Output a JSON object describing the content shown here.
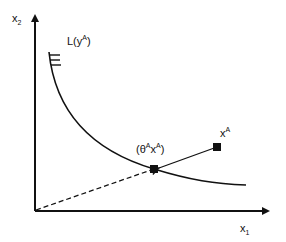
{
  "diagram": {
    "type": "isoquant-input-requirement-set",
    "axes": {
      "y_label": "x",
      "y_label_sub": "2",
      "x_label": "x",
      "x_label_sub": "1"
    },
    "curve_label": {
      "prefix": "L(y",
      "sup": "A",
      "suffix": ")"
    },
    "point_projected": {
      "open": "(θ",
      "sup1": "A",
      "mid": "x",
      "sup2": "A",
      "close": ")"
    },
    "point_original": {
      "base": "x",
      "sup": "A"
    },
    "colors": {
      "line": "#111111",
      "background": "#ffffff"
    }
  }
}
